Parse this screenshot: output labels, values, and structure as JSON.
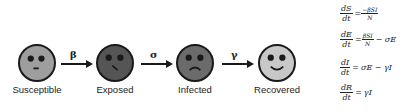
{
  "compartments": [
    {
      "id": "S",
      "label": "Susceptible",
      "color": "#9e9e9e",
      "expression": "neutral"
    },
    {
      "id": "E",
      "label": "Exposed",
      "color": "#555555",
      "expression": "smirk"
    },
    {
      "id": "I",
      "label": "Infected",
      "color": "#6b6b6b",
      "expression": "sad"
    },
    {
      "id": "R",
      "label": "Recovered",
      "color": "#c8c8c8",
      "expression": "happy"
    }
  ],
  "transitions": [
    {
      "from": "S",
      "to": "E",
      "rate": "β"
    },
    {
      "from": "E",
      "to": "I",
      "rate": "σ"
    },
    {
      "from": "I",
      "to": "R",
      "rate": "γ"
    }
  ],
  "equations": [
    {
      "lhs_num": "dS",
      "lhs_den": "dt",
      "eq": "=",
      "rhs_frac_num": "−βSI",
      "rhs_frac_den": "N",
      "rhs_tail": ""
    },
    {
      "lhs_num": "dE",
      "lhs_den": "dt",
      "eq": "=",
      "rhs_frac_num": "βSI",
      "rhs_frac_den": "N",
      "rhs_tail": "− σE"
    },
    {
      "lhs_num": "dI",
      "lhs_den": "dt",
      "eq": "=",
      "rhs_frac_num": "",
      "rhs_frac_den": "",
      "rhs_tail": "σE − γI"
    },
    {
      "lhs_num": "dR",
      "lhs_den": "dt",
      "eq": "=",
      "rhs_frac_num": "",
      "rhs_frac_den": "",
      "rhs_tail": "γI"
    }
  ]
}
